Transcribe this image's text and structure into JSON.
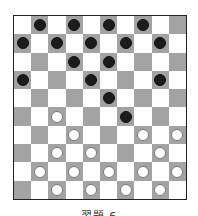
{
  "diagram": {
    "type": "draughts-board",
    "size": 10,
    "caption": "習題 6",
    "colors": {
      "light_square": "#ffffff",
      "dark_square": "#a3a3a3",
      "black_piece": "#1c1c1c",
      "white_piece": "#ffffff",
      "border": "#222222"
    },
    "pieces": {
      "black": [
        [
          0,
          1
        ],
        [
          0,
          3
        ],
        [
          0,
          5
        ],
        [
          0,
          7
        ],
        [
          1,
          0
        ],
        [
          1,
          2
        ],
        [
          1,
          4
        ],
        [
          1,
          6
        ],
        [
          1,
          8
        ],
        [
          2,
          3
        ],
        [
          2,
          5
        ],
        [
          3,
          0
        ],
        [
          3,
          4
        ],
        [
          3,
          8
        ],
        [
          4,
          5
        ],
        [
          5,
          6
        ]
      ],
      "white": [
        [
          5,
          2
        ],
        [
          6,
          3
        ],
        [
          6,
          7
        ],
        [
          6,
          9
        ],
        [
          7,
          2
        ],
        [
          7,
          4
        ],
        [
          7,
          8
        ],
        [
          8,
          1
        ],
        [
          8,
          3
        ],
        [
          8,
          5
        ],
        [
          8,
          7
        ],
        [
          8,
          9
        ],
        [
          9,
          2
        ],
        [
          9,
          4
        ],
        [
          9,
          6
        ],
        [
          9,
          8
        ]
      ]
    },
    "counts": {
      "black": 16,
      "white": 16
    }
  }
}
